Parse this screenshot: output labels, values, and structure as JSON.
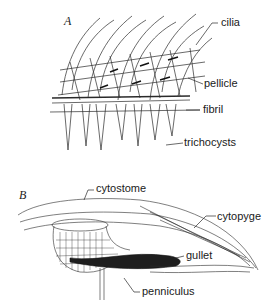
{
  "figure": {
    "panel_a": {
      "letter": "A",
      "labels": {
        "cilia": "cilia",
        "pellicle": "pellicle",
        "fibril": "fibril",
        "trichocysts": "trichocysts"
      }
    },
    "panel_b": {
      "letter": "B",
      "labels": {
        "cytostome": "cytostome",
        "cytopyge": "cytopyge",
        "gullet": "gullet",
        "penniculus": "penniculus"
      }
    }
  }
}
